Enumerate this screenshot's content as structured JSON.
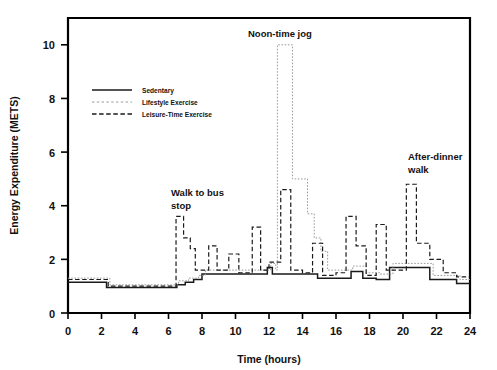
{
  "chart_data": {
    "type": "line",
    "title": "",
    "xlabel": "Time (hours)",
    "ylabel": "Energy Expenditure (METS)",
    "xlim": [
      0,
      24
    ],
    "ylim": [
      0,
      11
    ],
    "xticks": [
      0,
      2,
      4,
      6,
      8,
      10,
      12,
      14,
      16,
      18,
      20,
      22,
      24
    ],
    "yticks": [
      0,
      2,
      4,
      6,
      8,
      10
    ],
    "xtick_labels": [
      "0",
      "2",
      "4",
      "6",
      "8",
      "10",
      "12",
      "14",
      "16",
      "18",
      "20",
      "22",
      "24"
    ],
    "ytick_labels": [
      "0",
      "2",
      "4",
      "6",
      "8",
      "10"
    ],
    "grid": false,
    "legend_position": "upper-left-inside",
    "step_style": "post",
    "series": [
      {
        "name": "Sedentary",
        "style": "solid",
        "color": "#1a1a1a",
        "x": [
          0,
          2.0,
          2.3,
          6.2,
          6.5,
          7.0,
          7.5,
          8.0,
          9.0,
          11.6,
          11.9,
          12.2,
          14.6,
          14.9,
          16.6,
          16.9,
          17.6,
          17.9,
          18.4,
          19.2,
          19.9,
          21.6,
          22.0,
          23.2,
          24.0
        ],
        "y": [
          1.15,
          1.15,
          0.95,
          0.95,
          1.05,
          1.15,
          1.25,
          1.45,
          1.45,
          1.45,
          1.7,
          1.45,
          1.45,
          1.3,
          1.3,
          1.55,
          1.3,
          1.3,
          1.25,
          1.7,
          1.7,
          1.25,
          1.25,
          1.1,
          1.1
        ]
      },
      {
        "name": "Lifestyle Exercise",
        "style": "dotted",
        "color": "#9a9a9a",
        "x": [
          0,
          2.2,
          2.5,
          6.3,
          6.6,
          7.2,
          7.8,
          8.2,
          9.0,
          11.8,
          12.1,
          12.4,
          12.5,
          13.3,
          13.4,
          14.2,
          14.3,
          14.6,
          14.7,
          15.0,
          15.1,
          15.4,
          15.5,
          16.8,
          17.0,
          17.8,
          18.0,
          18.6,
          19.4,
          20.0,
          21.8,
          22.2,
          23.4,
          24.0
        ],
        "y": [
          1.3,
          1.3,
          1.05,
          1.05,
          1.2,
          1.3,
          1.4,
          1.6,
          1.6,
          1.6,
          1.85,
          1.6,
          10.0,
          10.0,
          5.0,
          5.0,
          3.7,
          3.7,
          2.8,
          2.8,
          2.3,
          2.3,
          1.6,
          1.6,
          1.75,
          1.5,
          1.5,
          1.45,
          1.85,
          1.85,
          1.4,
          1.4,
          1.25,
          1.25
        ]
      },
      {
        "name": "Leisure-Time Exercise",
        "style": "dashed",
        "color": "#1a1a1a",
        "x": [
          0,
          2.1,
          2.4,
          6.35,
          6.45,
          6.8,
          6.9,
          7.1,
          7.3,
          7.6,
          8.0,
          8.4,
          8.6,
          8.9,
          9.1,
          9.6,
          9.8,
          10.2,
          10.4,
          11.0,
          11.2,
          11.5,
          11.7,
          12.0,
          12.2,
          12.7,
          12.9,
          13.3,
          13.5,
          14.0,
          14.2,
          14.6,
          14.8,
          15.2,
          15.4,
          16.0,
          16.2,
          16.6,
          16.8,
          17.2,
          17.4,
          17.8,
          18.0,
          18.4,
          18.6,
          19.0,
          19.2,
          20.2,
          20.4,
          20.8,
          21.0,
          21.6,
          21.8,
          22.4,
          22.6,
          23.2,
          23.4,
          24.0
        ],
        "y": [
          1.25,
          1.25,
          1.0,
          1.0,
          3.6,
          3.6,
          2.8,
          2.8,
          2.4,
          1.6,
          1.6,
          2.5,
          2.5,
          1.6,
          1.6,
          2.2,
          2.2,
          1.5,
          1.5,
          3.2,
          3.2,
          1.6,
          1.6,
          1.9,
          1.9,
          4.6,
          4.6,
          1.6,
          1.6,
          1.5,
          1.5,
          2.6,
          2.6,
          1.4,
          1.4,
          1.5,
          1.5,
          3.6,
          3.6,
          2.5,
          2.5,
          1.4,
          1.4,
          3.3,
          3.3,
          1.6,
          1.6,
          4.8,
          4.8,
          2.6,
          2.6,
          2.0,
          2.0,
          1.5,
          1.5,
          1.35,
          1.35,
          1.35
        ]
      }
    ],
    "annotations": [
      {
        "id": "walk-to-bus-stop",
        "text_lines": [
          "Walk to bus",
          "stop"
        ],
        "x_px": 171,
        "y_px": 196
      },
      {
        "id": "noon-time-jog",
        "text_lines": [
          "Noon-time jog"
        ],
        "x_px": 248,
        "y_px": 37
      },
      {
        "id": "after-dinner-walk",
        "text_lines": [
          "After-dinner",
          "walk"
        ],
        "x_px": 408,
        "y_px": 160
      }
    ],
    "legend": [
      {
        "label": "Sedentary",
        "style": "solid"
      },
      {
        "label": "Lifestyle Exercise",
        "style": "dotted"
      },
      {
        "label": "Leisure-Time Exercise",
        "style": "dashed"
      }
    ]
  }
}
